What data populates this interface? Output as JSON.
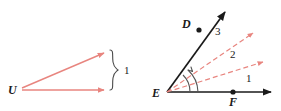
{
  "figure_left": {
    "name": "angle-figure-u",
    "vertex_label": "U",
    "bracket_label": "1",
    "ray_color": "#e8857f",
    "label_color": "#1a1a1a"
  },
  "figure_right": {
    "name": "angle-figure-e",
    "vertex_label": "E",
    "point_d_label": "D",
    "point_f_label": "F",
    "angle_label_1": "1",
    "angle_label_2": "2",
    "angle_label_3": "3",
    "solid_ray_color": "#1a1a1a",
    "dashed_ray_color": "#e8857f",
    "arc_color": "#555555",
    "label_color": "#1a1a1a"
  }
}
